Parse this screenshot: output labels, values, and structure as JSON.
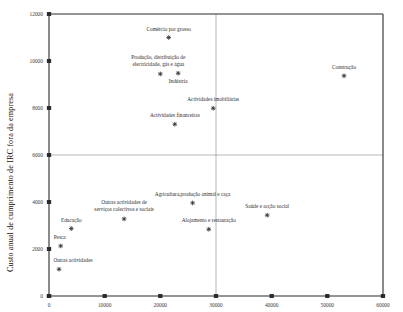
{
  "chart_data": {
    "type": "scatter",
    "title": "",
    "xlabel": "",
    "ylabel": "Custo anual de cumprimento de IRC fora da empresa",
    "xlim": [
      0,
      60000
    ],
    "ylim": [
      0,
      12000
    ],
    "xticks": [
      0,
      10000,
      20000,
      30000,
      40000,
      50000,
      60000
    ],
    "yticks": [
      0,
      2000,
      4000,
      6000,
      8000,
      10000,
      12000
    ],
    "xtick_labels": [
      "0",
      "10000",
      "20000",
      "30000",
      "40000",
      "50000",
      "60000"
    ],
    "ytick_labels": [
      "0",
      "2000",
      "4000",
      "6000",
      "8000",
      "10000",
      "12000"
    ],
    "grid": false,
    "legend": "none",
    "reference_lines": [
      {
        "orientation": "horizontal",
        "value": 6000,
        "color": "#9a9a9a"
      },
      {
        "orientation": "vertical",
        "value": 30000,
        "color": "#9a9a9a"
      }
    ],
    "marker_style": "asterisk",
    "points": [
      {
        "label": "Comércio por grosso",
        "x": 21500,
        "y": 11000,
        "label_dx": 0,
        "label_dy": -7
      },
      {
        "label": "Produção, distribuição de electricidade, gás e água",
        "x": 20000,
        "y": 9450,
        "label_dx": -2,
        "label_dy": -8,
        "label_lines": [
          "Produção, distribuição de",
          "electricidade, gás e água"
        ],
        "label_anchor": "above-multiline"
      },
      {
        "label": "Indústria",
        "x": 23200,
        "y": 9480,
        "label_dx": 0,
        "label_dy": 10
      },
      {
        "label": "Actividades imobiliárias",
        "x": 29500,
        "y": 7990,
        "label_dx": 0,
        "label_dy": -7
      },
      {
        "label": "Actividades financeiras",
        "x": 22600,
        "y": 7310,
        "label_dx": 0,
        "label_dy": -7
      },
      {
        "label": "Construção",
        "x": 53000,
        "y": 9370,
        "label_dx": 0,
        "label_dy": -7
      },
      {
        "label": "Agricultura,produção animal e caça",
        "x": 25800,
        "y": 3960,
        "label_dx": 0,
        "label_dy": -7
      },
      {
        "label": "Saúde e acção social",
        "x": 39200,
        "y": 3440,
        "label_dx": 0,
        "label_dy": -7
      },
      {
        "label": "Outras actividades de serviços colectivos e sociais",
        "x": 13500,
        "y": 3280,
        "label_dx": 0,
        "label_dy": -8,
        "label_lines": [
          "Outras actividades de",
          "serviços colectivos e sociais"
        ],
        "label_anchor": "above-multiline"
      },
      {
        "label": "Alojamento e restauração",
        "x": 28700,
        "y": 2840,
        "label_dx": 0,
        "label_dy": -7
      },
      {
        "label": "Educação",
        "x": 4000,
        "y": 2870,
        "label_dx": 0,
        "label_dy": -7
      },
      {
        "label": "Pesca",
        "x": 2100,
        "y": 2130,
        "label_dx": -1,
        "label_dy": -7
      },
      {
        "label": "Outras actividades",
        "x": 1800,
        "y": 1140,
        "label_dx": 14,
        "label_dy": -7
      }
    ]
  },
  "axis": {
    "ylabel": "Custo anual de cumprimento de IRC fora da empresa"
  }
}
